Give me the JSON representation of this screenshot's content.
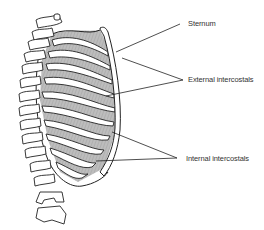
{
  "diagram": {
    "labels": [
      {
        "id": "sternum",
        "text": "Sternum"
      },
      {
        "id": "external-intercostals",
        "text": "External intercostals"
      },
      {
        "id": "internal-intercostals",
        "text": "Internal intercostals"
      }
    ],
    "colors": {
      "line": "#222222",
      "muscle_fill": "#b8b8b8",
      "bone_fill": "#ffffff",
      "text": "#333333"
    }
  }
}
